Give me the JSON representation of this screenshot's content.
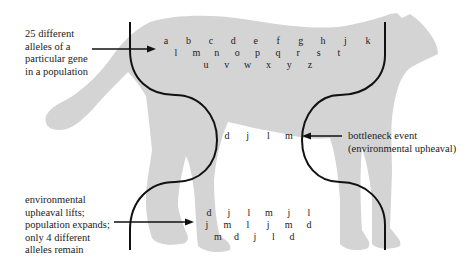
{
  "figure": {
    "type": "population bottleneck diagram",
    "colors": {
      "silhouette": "#d4d4d4",
      "lines": "#111111",
      "text": "#222222",
      "background": "#ffffff"
    },
    "icons": {
      "silhouette": "cheetah-silhouette-icon",
      "arrows": "arrow-right-icon"
    }
  },
  "labels": {
    "original_population": "25 different\nalleles of a\nparticular gene\nin a population",
    "bottleneck": "bottleneck event\n(environmental upheaval)",
    "recovered_population": "environmental\nupheaval lifts;\npopulation expands;\nonly 4 different\nalleles remain"
  },
  "alleles": {
    "original": [
      [
        "a",
        "b",
        "c",
        "d",
        "e",
        "f",
        "g",
        "h",
        "j",
        "k"
      ],
      [
        "l",
        "m",
        "n",
        "o",
        "p",
        "q",
        "r",
        "s",
        "t"
      ],
      [
        "u",
        "v",
        "w",
        "x",
        "y",
        "z"
      ]
    ],
    "bottleneck": [
      [
        "d",
        "j",
        "l",
        "m"
      ]
    ],
    "recovered": [
      [
        "d",
        "j",
        "l",
        "m",
        "j",
        "l"
      ],
      [
        "j",
        "m",
        "l",
        "j",
        "m",
        "d"
      ],
      [
        "m",
        "d",
        "j",
        "l",
        "d"
      ]
    ]
  }
}
